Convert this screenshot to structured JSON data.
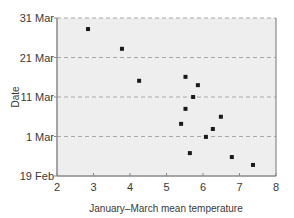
{
  "chart_data": {
    "type": "scatter",
    "title": "",
    "xlabel": "January–March mean temperature",
    "ylabel": "Date",
    "xlim": [
      2,
      8
    ],
    "ylim_days_from_19feb": [
      0,
      40
    ],
    "x_ticks": [
      "2",
      "3",
      "4",
      "5",
      "6",
      "7",
      "8"
    ],
    "y_ticks": [
      "19 Feb",
      "1 Mar",
      "11 Mar",
      "21 Mar",
      "31 Mar"
    ],
    "grid": "horizontal dashed",
    "legend": "none",
    "points": [
      {
        "x": 2.85,
        "date": "28 Mar",
        "day": 37.2
      },
      {
        "x": 3.78,
        "date": "23 Mar",
        "day": 32.2
      },
      {
        "x": 4.25,
        "date": "15 Mar",
        "day": 24.1
      },
      {
        "x": 5.52,
        "date": "16 Mar",
        "day": 25.1
      },
      {
        "x": 5.86,
        "date": "14 Mar",
        "day": 23.0
      },
      {
        "x": 5.73,
        "date": "11 Mar",
        "day": 20.0
      },
      {
        "x": 5.52,
        "date": "8 Mar",
        "day": 17.0
      },
      {
        "x": 6.49,
        "date": "6 Mar",
        "day": 15.0
      },
      {
        "x": 5.4,
        "date": "4 Mar",
        "day": 13.2
      },
      {
        "x": 6.27,
        "date": "3 Mar",
        "day": 11.9
      },
      {
        "x": 6.08,
        "date": "1 Mar",
        "day": 9.9
      },
      {
        "x": 5.64,
        "date": "25 Feb",
        "day": 5.8
      },
      {
        "x": 6.79,
        "date": "24 Feb",
        "day": 4.8
      },
      {
        "x": 7.37,
        "date": "22 Feb",
        "day": 2.8
      }
    ]
  },
  "colors": {
    "plot_bg": "#eeeeee",
    "frame": "#8a8a8a",
    "grid": "#a8a8a8",
    "marker": "#1a1a1a"
  }
}
